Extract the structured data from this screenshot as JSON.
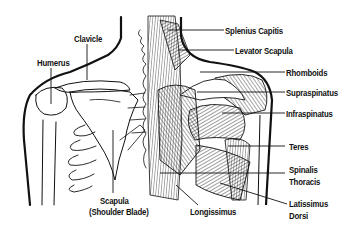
{
  "diagram": {
    "colors": {
      "background": "#ffffff",
      "ink": "#111111"
    },
    "labels": {
      "clavicle": "Clavicle",
      "humerus": "Humerus",
      "scapula_1": "Scapula",
      "scapula_2": "(Shoulder Blade)",
      "splenius_capitis": "Splenius Capitis",
      "levator_scapula": "Levator Scapula",
      "rhomboids": "Rhomboids",
      "supraspinatus": "Supraspinatus",
      "infraspinatus": "Infraspinatus",
      "teres": "Teres",
      "spinalis_1": "Spinalis",
      "spinalis_2": "Thoracis",
      "latissimus_1": "Latissimus",
      "latissimus_2": "Dorsi",
      "longissimus": "Longissimus"
    }
  }
}
